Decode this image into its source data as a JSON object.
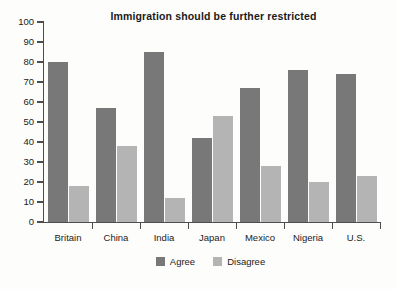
{
  "chart_data": {
    "type": "bar",
    "title": "Immigration should be further restricted",
    "xlabel": "",
    "ylabel": "",
    "ylim": [
      0,
      100
    ],
    "ytick_step": 10,
    "yticks": [
      0,
      10,
      20,
      30,
      40,
      50,
      60,
      70,
      80,
      90,
      100
    ],
    "grid": false,
    "legend_position": "bottom-center",
    "categories": [
      "Britain",
      "China",
      "India",
      "Japan",
      "Mexico",
      "Nigeria",
      "U.S."
    ],
    "series": [
      {
        "name": "Agree",
        "color": "#787878",
        "values": [
          80,
          57,
          85,
          42,
          67,
          76,
          74
        ]
      },
      {
        "name": "Disagree",
        "color": "#b4b4b4",
        "values": [
          18,
          38,
          12,
          53,
          28,
          20,
          23
        ]
      }
    ]
  },
  "colors": {
    "agree": "#787878",
    "disagree": "#b4b4b4",
    "axis": "#4d4d4d",
    "text": "#1b1b1b",
    "background": "#fdfdfc"
  }
}
